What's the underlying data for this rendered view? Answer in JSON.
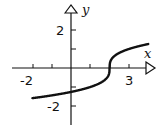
{
  "chart_data": {
    "type": "line",
    "title": "",
    "xlabel": "x",
    "ylabel": "y",
    "function": "y = cbrt(x - 2)",
    "xlim": [
      -2.5,
      4.2
    ],
    "ylim": [
      -3.0,
      3.3
    ],
    "x_tick_labels": [
      "-2",
      "3"
    ],
    "y_tick_labels": [
      "2",
      "-2"
    ],
    "x_ticks": [
      -2,
      -1,
      1,
      2,
      3
    ],
    "y_ticks": [
      -2,
      -1,
      1,
      2
    ],
    "grid": false,
    "series": [
      {
        "name": "curve",
        "x": [
          -2,
          -1,
          0,
          1,
          1.75,
          2,
          2.25,
          3,
          4
        ],
        "values": [
          -1.59,
          -1.44,
          -1.26,
          -1.0,
          -0.63,
          0,
          0.63,
          1.0,
          1.26
        ]
      }
    ]
  },
  "axes": {
    "x_label": "x",
    "y_label": "y",
    "x_tick_left": "-2",
    "x_tick_right": "3",
    "y_tick_top": "2",
    "y_tick_bottom": "-2"
  }
}
